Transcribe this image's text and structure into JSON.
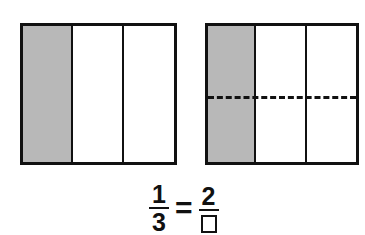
{
  "diagram": {
    "left_model": {
      "parts": 3,
      "shaded_parts": 1,
      "orientation": "vertical strips"
    },
    "right_model": {
      "columns": 3,
      "rows": 2,
      "shaded_parts": 2,
      "divider": "dashed horizontal line"
    },
    "equation": {
      "left_numerator": "1",
      "left_denominator": "3",
      "operator": "=",
      "right_numerator": "2",
      "right_denominator": ""
    },
    "colors": {
      "shade": "#b8b8b8",
      "line": "#111111"
    }
  }
}
